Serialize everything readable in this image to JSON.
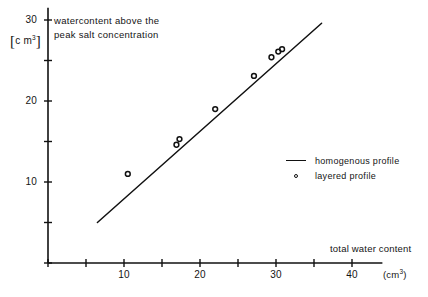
{
  "annotations": {
    "header_line1": "watercontent above the",
    "header_line2": "peak salt concentration",
    "yaxis_unit_prefix": "c m",
    "yaxis_unit_exponent": "3",
    "xaxis_title": "total water content",
    "xaxis_unit_prefix": "(cm",
    "xaxis_unit_exponent": "3",
    "xaxis_unit_suffix": ")"
  },
  "legend": {
    "position": "inside-right",
    "entries": [
      {
        "key": "line",
        "label": "homogenous  profile"
      },
      {
        "key": "circle",
        "label": "layered profile"
      }
    ]
  },
  "colors": {
    "axis": "#111111",
    "line": "#111111",
    "marker_stroke": "#111111",
    "background": "#ffffff"
  },
  "chart_data": {
    "type": "scatter",
    "title": "",
    "subtitle": "",
    "xlabel": "total water content (cm3)",
    "ylabel": "watercontent above the peak salt concentration [c m3]",
    "xlim": [
      0,
      44
    ],
    "ylim": [
      0,
      31.5
    ],
    "grid": false,
    "xticks": [
      0,
      5,
      10,
      15,
      20,
      25,
      30,
      35,
      40
    ],
    "xtick_labels": [
      "",
      "",
      "10",
      "",
      "20",
      "",
      "30",
      "",
      "40"
    ],
    "yticks": [
      0,
      5,
      10,
      15,
      20,
      25,
      30
    ],
    "ytick_labels": [
      "",
      "",
      "10",
      "",
      "20",
      "",
      "30"
    ],
    "series": [
      {
        "name": "homogenous  profile",
        "type": "line",
        "x": [
          6.5,
          36.0
        ],
        "y": [
          5.0,
          29.6
        ]
      },
      {
        "name": "layered profile",
        "type": "scatter",
        "points": [
          {
            "x": 10.5,
            "y": 11.0
          },
          {
            "x": 16.9,
            "y": 14.6
          },
          {
            "x": 17.3,
            "y": 15.3
          },
          {
            "x": 22.0,
            "y": 19.0
          },
          {
            "x": 27.1,
            "y": 23.1
          },
          {
            "x": 29.4,
            "y": 25.4
          },
          {
            "x": 30.3,
            "y": 26.1
          },
          {
            "x": 30.8,
            "y": 26.4
          }
        ]
      }
    ]
  }
}
